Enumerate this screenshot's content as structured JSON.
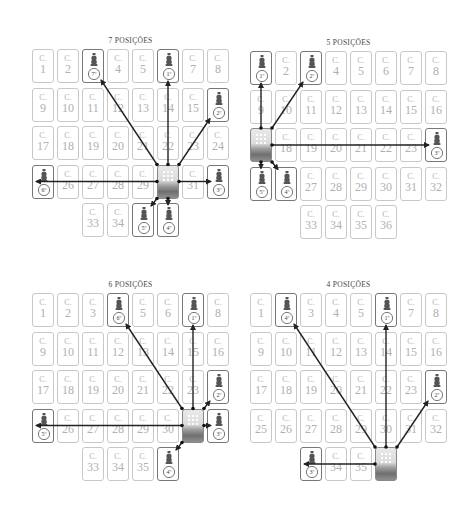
{
  "panels": [
    {
      "title": "7 POSIÇÕES",
      "origin": [
        32,
        49
      ],
      "cards": [
        {
          "r": 0,
          "c": 0,
          "n": "1"
        },
        {
          "r": 0,
          "c": 1,
          "n": "2"
        },
        {
          "r": 0,
          "c": 2,
          "piece": "7º"
        },
        {
          "r": 0,
          "c": 3,
          "n": "4"
        },
        {
          "r": 0,
          "c": 4,
          "n": "5"
        },
        {
          "r": 0,
          "c": 5,
          "piece": "1º"
        },
        {
          "r": 0,
          "c": 6,
          "n": "7"
        },
        {
          "r": 0,
          "c": 7,
          "n": "8"
        },
        {
          "r": 1,
          "c": 0,
          "n": "9"
        },
        {
          "r": 1,
          "c": 1,
          "n": "10"
        },
        {
          "r": 1,
          "c": 2,
          "n": "11"
        },
        {
          "r": 1,
          "c": 3,
          "n": "12"
        },
        {
          "r": 1,
          "c": 4,
          "n": "13"
        },
        {
          "r": 1,
          "c": 5,
          "n": "14"
        },
        {
          "r": 1,
          "c": 6,
          "n": "15"
        },
        {
          "r": 1,
          "c": 7,
          "piece": "2º"
        },
        {
          "r": 2,
          "c": 0,
          "n": "17"
        },
        {
          "r": 2,
          "c": 1,
          "n": "18"
        },
        {
          "r": 2,
          "c": 2,
          "n": "19"
        },
        {
          "r": 2,
          "c": 3,
          "n": "20"
        },
        {
          "r": 2,
          "c": 4,
          "n": "21"
        },
        {
          "r": 2,
          "c": 5,
          "n": "22"
        },
        {
          "r": 2,
          "c": 6,
          "n": "23"
        },
        {
          "r": 2,
          "c": 7,
          "n": "24"
        },
        {
          "r": 3,
          "c": 0,
          "piece": "6º"
        },
        {
          "r": 3,
          "c": 1,
          "n": "26"
        },
        {
          "r": 3,
          "c": 2,
          "n": "27"
        },
        {
          "r": 3,
          "c": 3,
          "n": "28"
        },
        {
          "r": 3,
          "c": 4,
          "n": "29"
        },
        {
          "r": 3,
          "c": 5,
          "deck": true
        },
        {
          "r": 3,
          "c": 6,
          "n": "31"
        },
        {
          "r": 3,
          "c": 7,
          "piece": "3º"
        },
        {
          "r": 4,
          "c": 2,
          "n": "33"
        },
        {
          "r": 4,
          "c": 3,
          "n": "34"
        },
        {
          "r": 4,
          "c": 4,
          "piece": "5º"
        },
        {
          "r": 4,
          "c": 5,
          "piece": "4º"
        }
      ]
    },
    {
      "title": "5 POSIÇÕES",
      "origin": [
        250,
        51
      ],
      "cards": [
        {
          "r": 0,
          "c": 0,
          "piece": "1º"
        },
        {
          "r": 0,
          "c": 1,
          "n": "2"
        },
        {
          "r": 0,
          "c": 2,
          "piece": "2º"
        },
        {
          "r": 0,
          "c": 3,
          "n": "4"
        },
        {
          "r": 0,
          "c": 4,
          "n": "5"
        },
        {
          "r": 0,
          "c": 5,
          "n": "6"
        },
        {
          "r": 0,
          "c": 6,
          "n": "7"
        },
        {
          "r": 0,
          "c": 7,
          "n": "8"
        },
        {
          "r": 1,
          "c": 0,
          "n": "9"
        },
        {
          "r": 1,
          "c": 1,
          "n": "10"
        },
        {
          "r": 1,
          "c": 2,
          "n": "11"
        },
        {
          "r": 1,
          "c": 3,
          "n": "12"
        },
        {
          "r": 1,
          "c": 4,
          "n": "13"
        },
        {
          "r": 1,
          "c": 5,
          "n": "14"
        },
        {
          "r": 1,
          "c": 6,
          "n": "15"
        },
        {
          "r": 1,
          "c": 7,
          "n": "16"
        },
        {
          "r": 2,
          "c": 0,
          "deck": true
        },
        {
          "r": 2,
          "c": 1,
          "n": "18"
        },
        {
          "r": 2,
          "c": 2,
          "n": "19"
        },
        {
          "r": 2,
          "c": 3,
          "n": "20"
        },
        {
          "r": 2,
          "c": 4,
          "n": "21"
        },
        {
          "r": 2,
          "c": 5,
          "n": "22"
        },
        {
          "r": 2,
          "c": 6,
          "n": "23"
        },
        {
          "r": 2,
          "c": 7,
          "piece": "3º"
        },
        {
          "r": 3,
          "c": 0,
          "piece": "5º"
        },
        {
          "r": 3,
          "c": 1,
          "piece": "4º"
        },
        {
          "r": 3,
          "c": 2,
          "n": "27"
        },
        {
          "r": 3,
          "c": 3,
          "n": "28"
        },
        {
          "r": 3,
          "c": 4,
          "n": "29"
        },
        {
          "r": 3,
          "c": 5,
          "n": "30"
        },
        {
          "r": 3,
          "c": 6,
          "n": "31"
        },
        {
          "r": 3,
          "c": 7,
          "n": "32"
        },
        {
          "r": 4,
          "c": 2,
          "n": "33"
        },
        {
          "r": 4,
          "c": 3,
          "n": "34"
        },
        {
          "r": 4,
          "c": 4,
          "n": "35"
        },
        {
          "r": 4,
          "c": 5,
          "n": "36"
        }
      ]
    },
    {
      "title": "6 POSIÇÕES",
      "origin": [
        32,
        293
      ],
      "cards": [
        {
          "r": 0,
          "c": 0,
          "n": "1"
        },
        {
          "r": 0,
          "c": 1,
          "n": "2"
        },
        {
          "r": 0,
          "c": 2,
          "n": "3"
        },
        {
          "r": 0,
          "c": 3,
          "piece": "6º"
        },
        {
          "r": 0,
          "c": 4,
          "n": "5"
        },
        {
          "r": 0,
          "c": 5,
          "n": "6"
        },
        {
          "r": 0,
          "c": 6,
          "piece": "1º"
        },
        {
          "r": 0,
          "c": 7,
          "n": "8"
        },
        {
          "r": 1,
          "c": 0,
          "n": "9"
        },
        {
          "r": 1,
          "c": 1,
          "n": "10"
        },
        {
          "r": 1,
          "c": 2,
          "n": "11"
        },
        {
          "r": 1,
          "c": 3,
          "n": "12"
        },
        {
          "r": 1,
          "c": 4,
          "n": "13"
        },
        {
          "r": 1,
          "c": 5,
          "n": "14"
        },
        {
          "r": 1,
          "c": 6,
          "n": "15"
        },
        {
          "r": 1,
          "c": 7,
          "n": "16"
        },
        {
          "r": 2,
          "c": 0,
          "n": "17"
        },
        {
          "r": 2,
          "c": 1,
          "n": "18"
        },
        {
          "r": 2,
          "c": 2,
          "n": "19"
        },
        {
          "r": 2,
          "c": 3,
          "n": "20"
        },
        {
          "r": 2,
          "c": 4,
          "n": "21"
        },
        {
          "r": 2,
          "c": 5,
          "n": "22"
        },
        {
          "r": 2,
          "c": 6,
          "n": "23"
        },
        {
          "r": 2,
          "c": 7,
          "piece": "2º"
        },
        {
          "r": 3,
          "c": 0,
          "piece": "5º"
        },
        {
          "r": 3,
          "c": 1,
          "n": "26"
        },
        {
          "r": 3,
          "c": 2,
          "n": "27"
        },
        {
          "r": 3,
          "c": 3,
          "n": "28"
        },
        {
          "r": 3,
          "c": 4,
          "n": "29"
        },
        {
          "r": 3,
          "c": 5,
          "n": "30"
        },
        {
          "r": 3,
          "c": 6,
          "deck": true
        },
        {
          "r": 3,
          "c": 7,
          "piece": "3º"
        },
        {
          "r": 4,
          "c": 2,
          "n": "33"
        },
        {
          "r": 4,
          "c": 3,
          "n": "34"
        },
        {
          "r": 4,
          "c": 4,
          "n": "35"
        },
        {
          "r": 4,
          "c": 5,
          "piece": "4º"
        }
      ]
    },
    {
      "title": "4 POSIÇÕES",
      "origin": [
        250,
        293
      ],
      "cards": [
        {
          "r": 0,
          "c": 0,
          "n": "1"
        },
        {
          "r": 0,
          "c": 1,
          "piece": "4º"
        },
        {
          "r": 0,
          "c": 2,
          "n": "3"
        },
        {
          "r": 0,
          "c": 3,
          "n": "4"
        },
        {
          "r": 0,
          "c": 4,
          "n": "5"
        },
        {
          "r": 0,
          "c": 5,
          "piece": "1º"
        },
        {
          "r": 0,
          "c": 6,
          "n": "7"
        },
        {
          "r": 0,
          "c": 7,
          "n": "8"
        },
        {
          "r": 1,
          "c": 0,
          "n": "9"
        },
        {
          "r": 1,
          "c": 1,
          "n": "10"
        },
        {
          "r": 1,
          "c": 2,
          "n": "11"
        },
        {
          "r": 1,
          "c": 3,
          "n": "12"
        },
        {
          "r": 1,
          "c": 4,
          "n": "13"
        },
        {
          "r": 1,
          "c": 5,
          "n": "14"
        },
        {
          "r": 1,
          "c": 6,
          "n": "15"
        },
        {
          "r": 1,
          "c": 7,
          "n": "16"
        },
        {
          "r": 2,
          "c": 0,
          "n": "17"
        },
        {
          "r": 2,
          "c": 1,
          "n": "18"
        },
        {
          "r": 2,
          "c": 2,
          "n": "19"
        },
        {
          "r": 2,
          "c": 3,
          "n": "20"
        },
        {
          "r": 2,
          "c": 4,
          "n": "21"
        },
        {
          "r": 2,
          "c": 5,
          "n": "22"
        },
        {
          "r": 2,
          "c": 6,
          "n": "23"
        },
        {
          "r": 2,
          "c": 7,
          "piece": "2º"
        },
        {
          "r": 3,
          "c": 0,
          "n": "25"
        },
        {
          "r": 3,
          "c": 1,
          "n": "26"
        },
        {
          "r": 3,
          "c": 2,
          "n": "27"
        },
        {
          "r": 3,
          "c": 3,
          "n": "28"
        },
        {
          "r": 3,
          "c": 4,
          "n": "29"
        },
        {
          "r": 3,
          "c": 5,
          "n": "30"
        },
        {
          "r": 3,
          "c": 6,
          "n": "31"
        },
        {
          "r": 3,
          "c": 7,
          "n": "32"
        },
        {
          "r": 4,
          "c": 2,
          "piece": "3º"
        },
        {
          "r": 4,
          "c": 3,
          "n": "34"
        },
        {
          "r": 4,
          "c": 4,
          "n": "35"
        },
        {
          "r": 4,
          "c": 5,
          "deck": true
        }
      ]
    }
  ],
  "card_letter": "C.",
  "colors": {
    "card_border": "#c8c8c8",
    "piece_border": "#777777",
    "text": "#b0b0b0",
    "arrow": "#222222"
  }
}
